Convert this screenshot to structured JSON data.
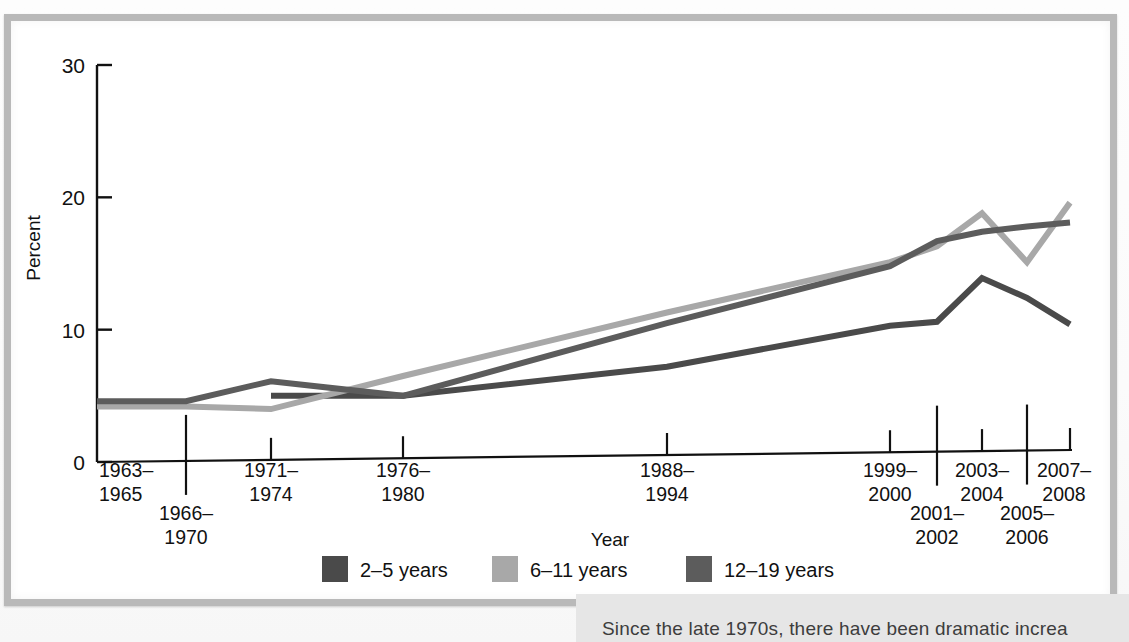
{
  "figure": {
    "frame_border_color": "#b9b9b9",
    "background": "#ffffff"
  },
  "caption": {
    "text": "Since the late 1970s, there have been dramatic increa"
  },
  "chart_data": {
    "type": "line",
    "title": "",
    "subtitle": "",
    "xlabel": "Year",
    "ylabel": "Percent",
    "ylim": [
      0,
      30
    ],
    "yticks": [
      "0",
      "10",
      "20",
      "30"
    ],
    "grid": false,
    "legend_position": "bottom-center",
    "categories": [
      "1963–1965",
      "1966–1970",
      "1971–1974",
      "1976–1980",
      "1988–1994",
      "1999–2000",
      "2001–2002",
      "2003–2004",
      "2005–2006",
      "2007–2008"
    ],
    "category_rows": [
      {
        "label": "1963–1965",
        "row": 0
      },
      {
        "label": "1966–1970",
        "row": 1
      },
      {
        "label": "1971–1974",
        "row": 0
      },
      {
        "label": "1976–1980",
        "row": 0
      },
      {
        "label": "1988–1994",
        "row": 0
      },
      {
        "label": "1999–2000",
        "row": 0
      },
      {
        "label": "2001–2002",
        "row": 1
      },
      {
        "label": "2003–2004",
        "row": 0
      },
      {
        "label": "2005–2006",
        "row": 1
      },
      {
        "label": "2007–2008",
        "row": 0
      }
    ],
    "series": [
      {
        "name": "2–5 years",
        "color": "#4a4a4a",
        "values": [
          null,
          null,
          5.0,
          5.0,
          7.2,
          10.3,
          10.6,
          13.9,
          12.4,
          10.4
        ]
      },
      {
        "name": "6–11 years",
        "color": "#a8a8a8",
        "values": [
          4.2,
          4.2,
          4.0,
          6.5,
          11.3,
          15.1,
          16.3,
          18.8,
          15.1,
          19.6
        ]
      },
      {
        "name": "12–19 years",
        "color": "#5c5c5c",
        "values": [
          4.6,
          4.6,
          6.1,
          5.0,
          10.5,
          14.8,
          16.7,
          17.4,
          17.8,
          18.1
        ]
      }
    ],
    "legend": [
      {
        "label": "2–5 years",
        "color": "#4a4a4a"
      },
      {
        "label": "6–11 years",
        "color": "#a8a8a8"
      },
      {
        "label": "12–19 years",
        "color": "#5c5c5c"
      }
    ]
  }
}
